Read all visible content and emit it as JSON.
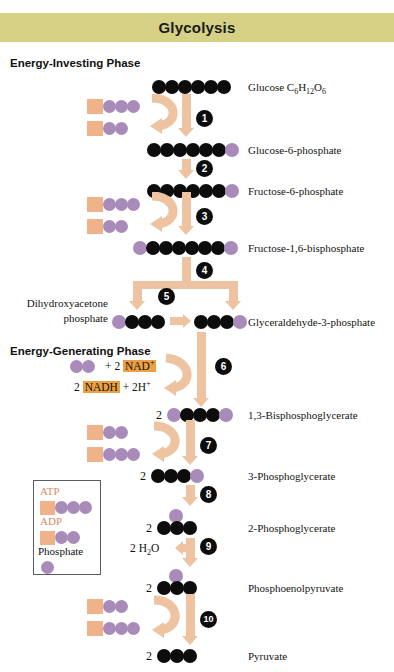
{
  "diagram": {
    "title": "Glycolysis",
    "title_bar_color": "#d6d184",
    "colors": {
      "carbon_circle": "#0c0c0c",
      "phosphate_circle": "#a98bba",
      "adenosine_square": "#f0b389",
      "arrow": "#eec3a2",
      "nad_highlight": "#eda040",
      "legend_label": "#dd8a6b"
    },
    "phases": [
      {
        "id": "energy-investing",
        "label": "Energy-Investing Phase"
      },
      {
        "id": "energy-generating",
        "label": "Energy-Generating Phase"
      }
    ],
    "compounds": [
      {
        "id": "glucose",
        "name": "Glucose C6H12O6",
        "formula_base": "Glucose C",
        "sub1": "6",
        "mid1": "H",
        "sub2": "12",
        "mid2": "O",
        "sub3": "6",
        "coefficient": "",
        "black": 6,
        "phosphate_left": 0,
        "phosphate_right": 0
      },
      {
        "id": "g6p",
        "name": "Glucose-6-phosphate",
        "coefficient": "",
        "black": 6,
        "phosphate_left": 0,
        "phosphate_right": 1
      },
      {
        "id": "f6p",
        "name": "Fructose-6-phosphate",
        "coefficient": "",
        "black": 6,
        "phosphate_left": 0,
        "phosphate_right": 1
      },
      {
        "id": "f16bp",
        "name": "Fructose-1,6-bisphosphate",
        "coefficient": "",
        "black": 6,
        "phosphate_left": 1,
        "phosphate_right": 1
      },
      {
        "id": "dhap",
        "name": "Dihydroxyacetone phosphate",
        "name_line1": "Dihydroxyacetone",
        "name_line2": "phosphate",
        "coefficient": "",
        "black": 3,
        "phosphate_left": 1,
        "phosphate_right": 0
      },
      {
        "id": "g3p",
        "name": "Glyceraldehyde-3-phosphate",
        "coefficient": "",
        "black": 3,
        "phosphate_left": 0,
        "phosphate_right": 1
      },
      {
        "id": "bpg13",
        "name": "1,3-Bisphosphoglycerate",
        "coefficient": "2",
        "black": 3,
        "phosphate_left": 1,
        "phosphate_right": 1
      },
      {
        "id": "pg3",
        "name": "3-Phosphoglycerate",
        "coefficient": "2",
        "black": 3,
        "phosphate_left": 0,
        "phosphate_right": 1
      },
      {
        "id": "pg2",
        "name": "2-Phosphoglycerate",
        "coefficient": "2",
        "black": 3,
        "phosphate_left": 0,
        "phosphate_right": 0,
        "phosphate_top": 1
      },
      {
        "id": "pep",
        "name": "Phosphoenolpyruvate",
        "coefficient": "2",
        "black": 3,
        "phosphate_left": 0,
        "phosphate_right": 0,
        "phosphate_top": 1
      },
      {
        "id": "pyruvate",
        "name": "Pyruvate",
        "coefficient": "2",
        "black": 3,
        "phosphate_left": 0,
        "phosphate_right": 0
      }
    ],
    "steps": [
      {
        "number": "1"
      },
      {
        "number": "2"
      },
      {
        "number": "3"
      },
      {
        "number": "4"
      },
      {
        "number": "5"
      },
      {
        "number": "6"
      },
      {
        "number": "7"
      },
      {
        "number": "8"
      },
      {
        "number": "9"
      },
      {
        "number": "10"
      }
    ],
    "cofactors": {
      "nad_plus": "NAD",
      "nad_plus_charge": "+",
      "nad_coefficient": "2",
      "nadh": "NADH",
      "nadh_coefficient": "2",
      "proton": "2H",
      "proton_charge": "+",
      "plus_sign_1": "+",
      "plus_sign_2": "+",
      "water": "2 H2O",
      "water_pre": "2 H",
      "water_sub": "2",
      "water_post": "O"
    },
    "legend": {
      "atp_label": "ATP",
      "adp_label": "ADP",
      "phosphate_label": "Phosphate",
      "atp_phosphates": 3,
      "adp_phosphates": 2
    }
  }
}
